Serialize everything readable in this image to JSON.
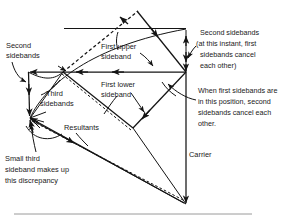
{
  "figure": {
    "type": "vector-phasor-diagram",
    "background_color": "#ffffff",
    "ink_color": "#141414"
  },
  "labels": {
    "second_sidebands_left": "Second\nsidebands",
    "second_sidebands_left_l1": "Second",
    "second_sidebands_left_l2": "sidebands",
    "first_upper_sideband_l1": "First upper",
    "first_upper_sideband_l2": "sideband",
    "first_lower_sideband_l1": "First lower",
    "first_lower_sideband_l2": "sideband",
    "third_sidebands_l1": "Third",
    "third_sidebands_l2": "sidebands",
    "resultants": "Resultants",
    "carrier": "Carrier",
    "small_third_l1": "Small third",
    "small_third_l2": "sideband makes up",
    "small_third_l3": "this discrepancy",
    "second_sidebands_note_l1": "Second sidebands",
    "second_sidebands_note_l2": "(at this instant, first",
    "second_sidebands_note_l3": "sidebands cancel",
    "second_sidebands_note_l4": "each other)",
    "first_sidebands_note_l1": "When first sidebands are",
    "first_sidebands_note_l2": "in this position, second",
    "first_sidebands_note_l3": "sidebands cancel each",
    "first_sidebands_note_l4": "other."
  },
  "geometry": {
    "carrier_top": [
      186,
      72
    ],
    "carrier_bottom": [
      186,
      205
    ],
    "left_vertex": [
      28,
      72
    ],
    "mid_vertex": [
      63,
      72
    ],
    "lower_left_vertex": [
      30,
      118
    ],
    "upper_tip": [
      138,
      10
    ],
    "top_rail_y": 28,
    "image_width": 296,
    "image_height": 219
  }
}
